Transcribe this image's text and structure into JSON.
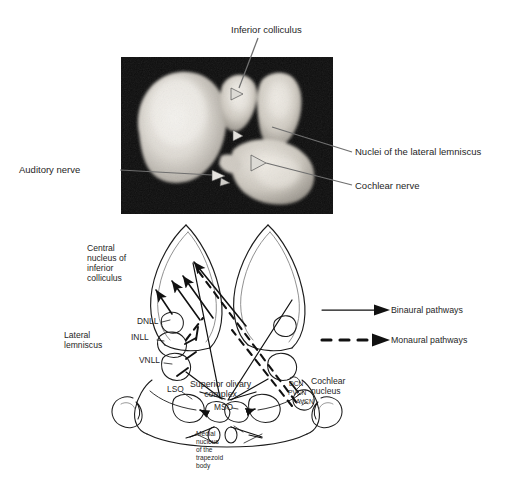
{
  "figure": {
    "background_color": "#ffffff",
    "panels": [
      "photograph",
      "schematic"
    ]
  },
  "photo": {
    "frame_color": "#0d0d0d",
    "leader_color": "#6b6b6b",
    "labels": {
      "inferior_colliculus": "Inferior colliculus",
      "auditory_nerve": "Auditory nerve",
      "nuclei_lateral_lemniscus": "Nuclei of the lateral lemniscus",
      "cochlear_nerve": "Cochlear nerve"
    }
  },
  "diagram": {
    "stroke_color": "#1a1a1a",
    "labels": {
      "central_nucleus": "Central\nnucleus of\ninferior\ncolliculus",
      "lateral_lemniscus": "Lateral\nlemniscus",
      "dnll": "DNLL",
      "inll": "INLL",
      "vnll": "VNLL",
      "lso": "LSO",
      "mso": "MSO",
      "superior_olivary_complex": "Superior olivary\ncomplex",
      "medial_nucleus_trapezoid_body": "Medial\nnucleus\nof the\ntrapezoid\nbody",
      "dcn": "DCN",
      "pvcn": "PVCN",
      "avcn": "AVCN",
      "cochlear_nucleus": "Cochlear\nnucleus"
    }
  },
  "legend": {
    "items": [
      {
        "key": "binaural",
        "label": "Binaural pathways",
        "line_style": "solid"
      },
      {
        "key": "monaural",
        "label": "Monaural pathways",
        "line_style": "dashed"
      }
    ]
  }
}
